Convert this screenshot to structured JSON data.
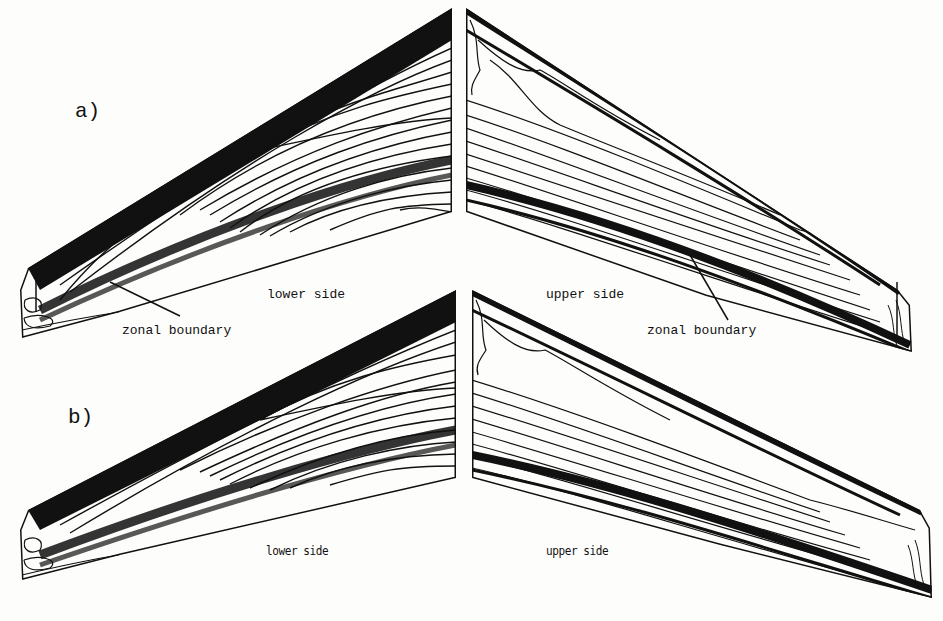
{
  "figure": {
    "panels": [
      {
        "id": "a",
        "label": "a)",
        "left_wing_label": "lower side",
        "right_wing_label": "upper side",
        "annotations": [
          "zonal boundary",
          "zonal boundary"
        ]
      },
      {
        "id": "b",
        "label": "b)",
        "left_wing_label": "lower side",
        "right_wing_label": "upper side"
      }
    ],
    "colors": {
      "ink": "#111111",
      "paper": "#fdfdfb"
    }
  }
}
